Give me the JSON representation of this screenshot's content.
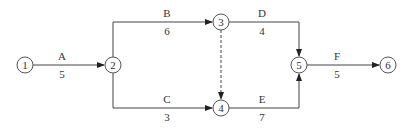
{
  "diagram": {
    "type": "activity-on-arrow network",
    "nodes": [
      {
        "id": "1",
        "x": 25,
        "y": 65
      },
      {
        "id": "2",
        "x": 113,
        "y": 65
      },
      {
        "id": "3",
        "x": 221,
        "y": 22
      },
      {
        "id": "4",
        "x": 221,
        "y": 108
      },
      {
        "id": "5",
        "x": 299,
        "y": 65
      },
      {
        "id": "6",
        "x": 388,
        "y": 65
      }
    ],
    "activities": [
      {
        "name": "A",
        "duration": "5",
        "from": "1",
        "to": "2"
      },
      {
        "name": "B",
        "duration": "6",
        "from": "2",
        "to": "3"
      },
      {
        "name": "C",
        "duration": "3",
        "from": "2",
        "to": "4"
      },
      {
        "name": "D",
        "duration": "4",
        "from": "3",
        "to": "5"
      },
      {
        "name": "E",
        "duration": "7",
        "from": "4",
        "to": "5"
      },
      {
        "name": "F",
        "duration": "5",
        "from": "5",
        "to": "6"
      }
    ],
    "dummy_activities": [
      {
        "from": "3",
        "to": "4",
        "style": "dashed"
      }
    ]
  }
}
